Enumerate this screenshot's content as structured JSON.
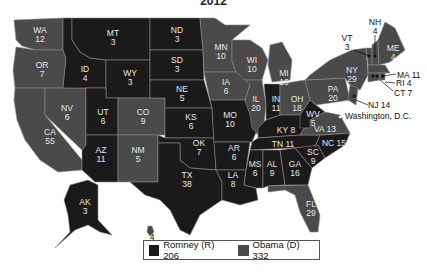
{
  "title": "2012",
  "colors": {
    "romney": "#1a1a1a",
    "obama": "#4a4a4a",
    "border": "#8a8a8a",
    "label": "#e8e8e8"
  },
  "legend": {
    "romney": "Romney (R) 206",
    "obama": "Obama (D) 332"
  },
  "states": [
    {
      "abbr": "WA",
      "ev": "12",
      "party": "D"
    },
    {
      "abbr": "OR",
      "ev": "7",
      "party": "D"
    },
    {
      "abbr": "CA",
      "ev": "55",
      "party": "D"
    },
    {
      "abbr": "NV",
      "ev": "6",
      "party": "D"
    },
    {
      "abbr": "ID",
      "ev": "4",
      "party": "R"
    },
    {
      "abbr": "MT",
      "ev": "3",
      "party": "R"
    },
    {
      "abbr": "WY",
      "ev": "3",
      "party": "R"
    },
    {
      "abbr": "UT",
      "ev": "6",
      "party": "R"
    },
    {
      "abbr": "AZ",
      "ev": "11",
      "party": "R"
    },
    {
      "abbr": "CO",
      "ev": "9",
      "party": "D"
    },
    {
      "abbr": "NM",
      "ev": "5",
      "party": "D"
    },
    {
      "abbr": "ND",
      "ev": "3",
      "party": "R"
    },
    {
      "abbr": "SD",
      "ev": "3",
      "party": "R"
    },
    {
      "abbr": "NE",
      "ev": "5",
      "party": "R"
    },
    {
      "abbr": "KS",
      "ev": "6",
      "party": "R"
    },
    {
      "abbr": "OK",
      "ev": "7",
      "party": "R"
    },
    {
      "abbr": "TX",
      "ev": "38",
      "party": "R"
    },
    {
      "abbr": "MN",
      "ev": "10",
      "party": "D"
    },
    {
      "abbr": "IA",
      "ev": "6",
      "party": "D"
    },
    {
      "abbr": "MO",
      "ev": "10",
      "party": "R"
    },
    {
      "abbr": "AR",
      "ev": "6",
      "party": "R"
    },
    {
      "abbr": "LA",
      "ev": "8",
      "party": "R"
    },
    {
      "abbr": "WI",
      "ev": "10",
      "party": "D"
    },
    {
      "abbr": "IL",
      "ev": "20",
      "party": "D"
    },
    {
      "abbr": "MI",
      "ev": "16",
      "party": "D"
    },
    {
      "abbr": "IN",
      "ev": "11",
      "party": "R"
    },
    {
      "abbr": "OH",
      "ev": "18",
      "party": "D"
    },
    {
      "abbr": "KY",
      "ev": "8",
      "party": "R"
    },
    {
      "abbr": "TN",
      "ev": "11",
      "party": "R"
    },
    {
      "abbr": "MS",
      "ev": "6",
      "party": "R"
    },
    {
      "abbr": "AL",
      "ev": "9",
      "party": "R"
    },
    {
      "abbr": "GA",
      "ev": "16",
      "party": "R"
    },
    {
      "abbr": "FL",
      "ev": "29",
      "party": "D"
    },
    {
      "abbr": "SC",
      "ev": "9",
      "party": "R"
    },
    {
      "abbr": "NC",
      "ev": "15",
      "party": "R"
    },
    {
      "abbr": "VA",
      "ev": "13",
      "party": "D"
    },
    {
      "abbr": "WV",
      "ev": "5",
      "party": "R"
    },
    {
      "abbr": "PA",
      "ev": "20",
      "party": "D"
    },
    {
      "abbr": "NY",
      "ev": "29",
      "party": "D"
    },
    {
      "abbr": "VT",
      "ev": "3",
      "party": "D"
    },
    {
      "abbr": "NH",
      "ev": "4",
      "party": "D"
    },
    {
      "abbr": "ME",
      "ev": "4",
      "party": "D"
    },
    {
      "abbr": "MA",
      "ev": "11",
      "party": "D"
    },
    {
      "abbr": "RI",
      "ev": "4",
      "party": "D"
    },
    {
      "abbr": "CT",
      "ev": "7",
      "party": "D"
    },
    {
      "abbr": "NJ",
      "ev": "14",
      "party": "D"
    },
    {
      "abbr": "AK",
      "ev": "3",
      "party": "R"
    },
    {
      "abbr": "HI",
      "ev": "4",
      "party": "D"
    }
  ],
  "callouts": {
    "vt": "VT",
    "vt_ev": "3",
    "nh": "NH",
    "nh_ev": "4",
    "ma": "MA 11",
    "ri": "RI 4",
    "ct": "CT 7",
    "nj": "NJ 14",
    "dc": "Washington, D.C.",
    "ky": "KY 8",
    "tn": "TN 11",
    "nc": "NC 15",
    "va": "VA 13"
  }
}
